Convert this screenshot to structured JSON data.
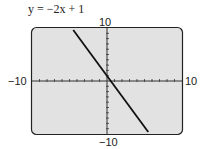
{
  "chart_data": {
    "type": "line",
    "title": "y = −2x + 1",
    "equation": {
      "slope": -2,
      "intercept": 1
    },
    "x": [
      -4.5,
      5.5
    ],
    "y": [
      10,
      -10
    ],
    "xlim": [
      -10,
      10
    ],
    "ylim": [
      -10,
      10
    ],
    "tick_labels": {
      "x_min": "−10",
      "x_max": "10",
      "y_min": "−10",
      "y_max": "10"
    },
    "xtick_step": 1,
    "ytick_step": 1,
    "grid": false,
    "colors": {
      "screen": "#e2e2e2",
      "line": "#111111",
      "frame": "#222222"
    }
  }
}
